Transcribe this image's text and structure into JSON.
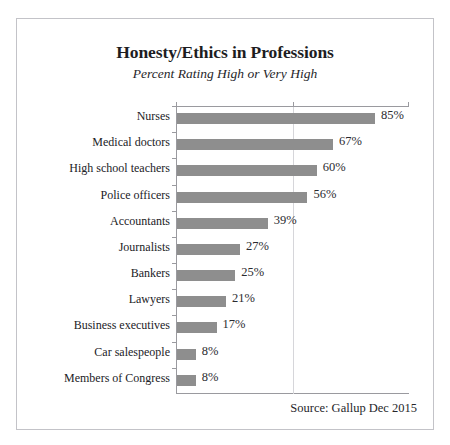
{
  "figure": {
    "title": "Honesty/Ethics in Professions",
    "subtitle": "Percent Rating High or Very High",
    "source_note": "Source: Gallup Dec 2015",
    "bar_color": "#8e8e8e",
    "gridline_color": "#d6d6da",
    "axis_color": "#9a9a9f",
    "border_color": "#c3c3c8",
    "background": "#ffffff"
  },
  "scan_artifact": {
    "fragment_a": "·  ·",
    "fragment_b": "· · ·",
    "fragment_c": "·"
  },
  "chart_data": {
    "type": "bar",
    "orientation": "horizontal",
    "title": "Honesty/Ethics in Professions",
    "subtitle": "Percent Rating High or Very High",
    "xlabel": "",
    "ylabel": "",
    "xlim": [
      0,
      100
    ],
    "grid": "single vertical gridline at 50",
    "gridlines": [
      50
    ],
    "xticks": [
      0,
      50,
      100
    ],
    "legend": "none",
    "value_label_suffix": "%",
    "categories": [
      "Nurses",
      "Medical doctors",
      "High school teachers",
      "Police officers",
      "Accountants",
      "Journalists",
      "Bankers",
      "Lawyers",
      "Business executives",
      "Car salespeople",
      "Members of Congress"
    ],
    "values": [
      85,
      67,
      60,
      56,
      39,
      27,
      25,
      21,
      17,
      8,
      8
    ],
    "value_labels": [
      "85%",
      "67%",
      "60%",
      "56%",
      "39%",
      "27%",
      "25%",
      "21%",
      "17%",
      "8%",
      "8%"
    ],
    "source": "Source: Gallup Dec 2015"
  }
}
